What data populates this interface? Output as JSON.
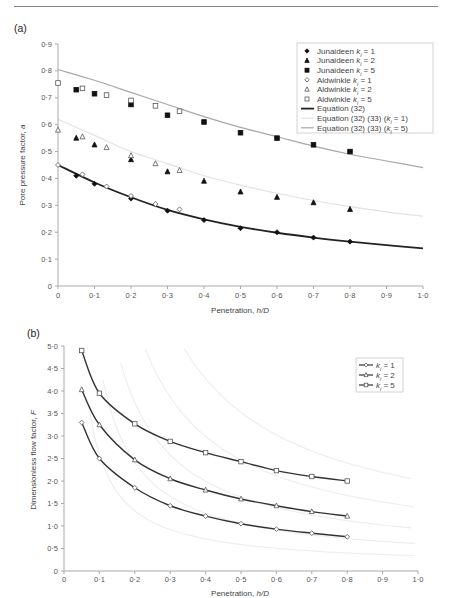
{
  "header": {
    "running_text": ""
  },
  "chart_data": [
    {
      "panel": "(a)",
      "type": "scatter",
      "title": "",
      "xlabel": "Penetration, h/D",
      "ylabel": "Pore pressure factor, a",
      "xlim": [
        0,
        1.0
      ],
      "ylim": [
        0,
        0.9
      ],
      "xticks": [
        "0",
        "0·1",
        "0·2",
        "0·3",
        "0·4",
        "0·5",
        "0·6",
        "0·7",
        "0·8",
        "0·9",
        "1·0"
      ],
      "yticks": [
        "0",
        "0·1",
        "0·2",
        "0·3",
        "0·4",
        "0·5",
        "0·6",
        "0·7",
        "0·8",
        "0·9"
      ],
      "grid": false,
      "legend_position": "upper right",
      "series": [
        {
          "name": "Junaideen k_i = 1",
          "marker": "filled-diamond",
          "x": [
            0.05,
            0.1,
            0.2,
            0.3,
            0.4,
            0.5,
            0.6,
            0.7,
            0.8
          ],
          "y": [
            0.41,
            0.38,
            0.325,
            0.28,
            0.245,
            0.215,
            0.2,
            0.18,
            0.165
          ]
        },
        {
          "name": "Junaideen k_i = 2",
          "marker": "filled-triangle",
          "x": [
            0.05,
            0.1,
            0.2,
            0.3,
            0.4,
            0.5,
            0.6,
            0.7,
            0.8
          ],
          "y": [
            0.55,
            0.525,
            0.47,
            0.425,
            0.39,
            0.35,
            0.33,
            0.31,
            0.285
          ]
        },
        {
          "name": "Junaideen k_i = 5",
          "marker": "filled-square",
          "x": [
            0.05,
            0.1,
            0.2,
            0.3,
            0.4,
            0.5,
            0.6,
            0.7,
            0.8
          ],
          "y": [
            0.73,
            0.715,
            0.675,
            0.635,
            0.61,
            0.57,
            0.55,
            0.525,
            0.5
          ]
        },
        {
          "name": "Aldwinkle k_i = 1",
          "marker": "open-diamond",
          "x": [
            0,
            0.067,
            0.133,
            0.2,
            0.267,
            0.333
          ],
          "y": [
            0.45,
            0.415,
            0.37,
            0.335,
            0.305,
            0.285
          ]
        },
        {
          "name": "Aldwinkle k_i = 2",
          "marker": "open-triangle",
          "x": [
            0,
            0.067,
            0.133,
            0.2,
            0.267,
            0.333
          ],
          "y": [
            0.58,
            0.555,
            0.515,
            0.485,
            0.455,
            0.43
          ]
        },
        {
          "name": "Aldwinkle k_i = 5",
          "marker": "open-square",
          "x": [
            0,
            0.067,
            0.133,
            0.2,
            0.267,
            0.333
          ],
          "y": [
            0.755,
            0.735,
            0.71,
            0.69,
            0.67,
            0.65
          ]
        },
        {
          "name": "Equation (32)",
          "line": "thick-black",
          "x": [
            0,
            0.1,
            0.2,
            0.3,
            0.4,
            0.5,
            0.6,
            0.7,
            0.8,
            0.9,
            1.0
          ],
          "y": [
            0.45,
            0.385,
            0.33,
            0.283,
            0.248,
            0.22,
            0.198,
            0.18,
            0.165,
            0.152,
            0.14
          ]
        },
        {
          "name": "Equation (32) (33) (k_i = 1)",
          "line": "very-light-gray",
          "x": [
            0,
            0.1,
            0.2,
            0.3,
            0.4,
            0.5,
            0.6,
            0.7,
            0.8,
            0.9,
            1.0
          ],
          "y": [
            0.62,
            0.56,
            0.5,
            0.455,
            0.41,
            0.375,
            0.345,
            0.318,
            0.295,
            0.276,
            0.26
          ]
        },
        {
          "name": "Equation (32) (33) (k_i = 5)",
          "line": "gray",
          "x": [
            0,
            0.1,
            0.2,
            0.3,
            0.4,
            0.5,
            0.6,
            0.7,
            0.8,
            0.9,
            1.0
          ],
          "y": [
            0.805,
            0.765,
            0.72,
            0.675,
            0.63,
            0.59,
            0.555,
            0.52,
            0.49,
            0.465,
            0.44
          ]
        }
      ]
    },
    {
      "panel": "(b)",
      "type": "line",
      "title": "",
      "xlabel": "Penetration, h/D",
      "ylabel": "Dimensionless flow factor, F",
      "xlim": [
        0,
        1.0
      ],
      "ylim": [
        0,
        5.0
      ],
      "xticks": [
        "0",
        "0·1",
        "0·2",
        "0·3",
        "0·4",
        "0·5",
        "0·6",
        "0·7",
        "0·8",
        "0·9",
        "1·0"
      ],
      "yticks": [
        "0",
        "0·5",
        "1·0",
        "1·5",
        "2·0",
        "2·5",
        "3·0",
        "3·5",
        "4·0",
        "4·5",
        "5·0"
      ],
      "grid": false,
      "legend_position": "upper right",
      "x": [
        0.05,
        0.1,
        0.2,
        0.3,
        0.4,
        0.5,
        0.6,
        0.7,
        0.8
      ],
      "series": [
        {
          "name": "k_i = 1",
          "marker": "open-diamond",
          "values": [
            3.3,
            2.5,
            1.85,
            1.45,
            1.22,
            1.05,
            0.93,
            0.84,
            0.76
          ]
        },
        {
          "name": "k_i = 2",
          "marker": "open-triangle",
          "values": [
            4.03,
            3.25,
            2.47,
            2.05,
            1.8,
            1.6,
            1.45,
            1.32,
            1.22
          ]
        },
        {
          "name": "k_i = 5",
          "marker": "open-square",
          "values": [
            4.9,
            3.95,
            3.27,
            2.88,
            2.63,
            2.43,
            2.23,
            2.1,
            2.0
          ]
        }
      ],
      "background_curves": "faint gray hyperbolic contour curves"
    }
  ],
  "labels": {
    "panel_a": "(a)",
    "panel_b": "(b)",
    "a_ylabel": "Pore pressure factor, a",
    "a_xlabel": "Penetration, h/D",
    "b_ylabel": "Dimensionless flow factor, F",
    "b_xlabel": "Penetration, h/D"
  },
  "legend_a": [
    {
      "prefix": "Junaideen ",
      "k": "k",
      "sub": "i",
      "suffix": " = 1"
    },
    {
      "prefix": "Junaideen ",
      "k": "k",
      "sub": "i",
      "suffix": " = 2"
    },
    {
      "prefix": "Junaideen ",
      "k": "k",
      "sub": "i",
      "suffix": " = 5"
    },
    {
      "prefix": "Aldwinkle ",
      "k": "k",
      "sub": "i",
      "suffix": " = 1"
    },
    {
      "prefix": "Aldwinkle ",
      "k": "k",
      "sub": "i",
      "suffix": " = 2"
    },
    {
      "prefix": "Aldwinkle ",
      "k": "k",
      "sub": "i",
      "suffix": " = 5"
    },
    {
      "text": "Equation (32)"
    },
    {
      "text": "Equation (32) (33) (k",
      "sub": "i",
      "suffix": " = 1)"
    },
    {
      "text": "Equation (32) (33) (k",
      "sub": "i",
      "suffix": " = 5)"
    }
  ],
  "legend_b": [
    {
      "k": "k",
      "sub": "i",
      "suffix": " = 1"
    },
    {
      "k": "k",
      "sub": "i",
      "suffix": " = 2"
    },
    {
      "k": "k",
      "sub": "i",
      "suffix": " = 5"
    }
  ],
  "colors": {
    "axis": "#aaaaaa",
    "data_black": "#111111",
    "eq32": "#222222",
    "eq_ki1": "#e2e2e2",
    "eq_ki5": "#a8a8a8",
    "bg_curves": "#eeeeee"
  }
}
